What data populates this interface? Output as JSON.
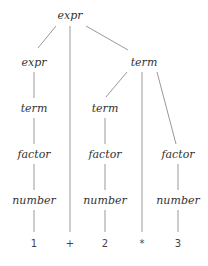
{
  "diagram": {
    "type": "parse-tree",
    "edge_color": "#999999",
    "text_color": "#333333",
    "nodes": {
      "root": {
        "label": "expr",
        "x": 70,
        "y": 15
      },
      "expr_l": {
        "label": "expr",
        "x": 34,
        "y": 62
      },
      "term_r": {
        "label": "term",
        "x": 144,
        "y": 62
      },
      "term_l": {
        "label": "term",
        "x": 34,
        "y": 108
      },
      "term_m": {
        "label": "term",
        "x": 105,
        "y": 108
      },
      "factor_l": {
        "label": "factor",
        "x": 34,
        "y": 154
      },
      "factor_m": {
        "label": "factor",
        "x": 105,
        "y": 154
      },
      "factor_r": {
        "label": "factor",
        "x": 178,
        "y": 154
      },
      "number_l": {
        "label": "number",
        "x": 34,
        "y": 200
      },
      "number_m": {
        "label": "number",
        "x": 105,
        "y": 200
      },
      "number_r": {
        "label": "number",
        "x": 178,
        "y": 200
      }
    },
    "leaves": {
      "one": {
        "label": "1",
        "x": 34,
        "y": 244
      },
      "plus": {
        "label": "+",
        "x": 70,
        "y": 244
      },
      "two": {
        "label": "2",
        "x": 105,
        "y": 244
      },
      "star": {
        "label": "*",
        "x": 142,
        "y": 244
      },
      "three": {
        "label": "3",
        "x": 178,
        "y": 244
      }
    }
  }
}
